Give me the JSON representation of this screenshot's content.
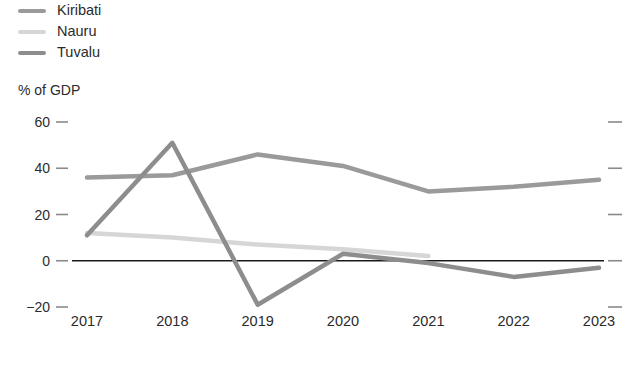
{
  "legend": {
    "items": [
      {
        "label": "Kiribati",
        "color": "#9a9a9a",
        "icon": "line-swatch"
      },
      {
        "label": "Nauru",
        "color": "#d6d6d6",
        "icon": "line-swatch"
      },
      {
        "label": "Tuvalu",
        "color": "#8d8d8d",
        "icon": "line-swatch"
      }
    ]
  },
  "axis": {
    "y_title": "% of GDP",
    "y_ticks": [
      "60",
      "40",
      "20",
      "0",
      "−20"
    ],
    "x_ticks": [
      "2017",
      "2018",
      "2019",
      "2020",
      "2021",
      "2022",
      "2023"
    ]
  },
  "annotations": {
    "forecast": "Forecast"
  },
  "colors": {
    "kiribati": "#9a9a9a",
    "nauru": "#d6d6d6",
    "tuvalu": "#8d8d8d",
    "zero_line": "#1a1a1a",
    "tick": "#8a8a8a",
    "forecast_band": "#f2f2f2",
    "background": "#ffffff",
    "text": "#2b2b2b"
  },
  "chart_data": {
    "type": "line",
    "title": "",
    "xlabel": "",
    "ylabel": "% of GDP",
    "categories": [
      "2017",
      "2018",
      "2019",
      "2020",
      "2021",
      "2022",
      "2023"
    ],
    "ylim": [
      -20,
      60
    ],
    "yticks": [
      60,
      40,
      20,
      0,
      -20
    ],
    "grid": false,
    "legend_position": "top-left",
    "zero_line": 0,
    "forecast_start": "2021.5",
    "forecast_end": "2023",
    "forecast_label": "Forecast",
    "series": [
      {
        "name": "Kiribati",
        "color": "#9a9a9a",
        "values": [
          36,
          37,
          46,
          41,
          30,
          32,
          35
        ]
      },
      {
        "name": "Nauru",
        "color": "#d6d6d6",
        "values": [
          12,
          10,
          7,
          5,
          2,
          null,
          null
        ]
      },
      {
        "name": "Tuvalu",
        "color": "#8d8d8d",
        "values": [
          11,
          51,
          -19,
          3,
          -1,
          -7,
          -3
        ]
      }
    ]
  }
}
